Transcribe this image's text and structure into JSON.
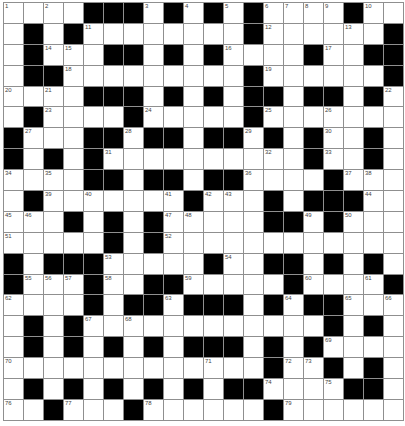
{
  "puzzle": {
    "rows": 20,
    "cols": 20,
    "colors": {
      "block": "#000000",
      "cell": "#ffffff",
      "gridline": "#8f8f8f",
      "number": "#444444"
    },
    "grid": [
      "....###.#.#.#....#..",
      ".#.#........#......#",
      ".#...##.#.#....#..##",
      ".##.........#......#",
      "....###.#.#.##.##.#.",
      ".#....#.....#.......",
      "#...##.##.##.#.#..#.",
      "#.#.#..........#..#.",
      "....##.##.##....#...",
      ".#.......#...#.###..",
      "...#.#.#.....##.#...",
      ".....#.#............",
      "#.###.....#..##.#.#.",
      "#...#..##.....#....#",
      "....#.##.###.#.##...",
      ".#.#............#.#.",
      ".#.#.#.#.###.#.#....",
      ".............#..#.#.",
      ".#.#.#.#.#.##....##.",
      "..#...#......#......"
    ],
    "numbers": [
      {
        "r": 0,
        "c": 0,
        "n": "1"
      },
      {
        "r": 0,
        "c": 2,
        "n": "2"
      },
      {
        "r": 0,
        "c": 7,
        "n": "3"
      },
      {
        "r": 0,
        "c": 9,
        "n": "4"
      },
      {
        "r": 0,
        "c": 11,
        "n": "5"
      },
      {
        "r": 0,
        "c": 13,
        "n": "6"
      },
      {
        "r": 0,
        "c": 14,
        "n": "7"
      },
      {
        "r": 0,
        "c": 15,
        "n": "8"
      },
      {
        "r": 0,
        "c": 16,
        "n": "9"
      },
      {
        "r": 0,
        "c": 18,
        "n": "10"
      },
      {
        "r": 1,
        "c": 4,
        "n": "11"
      },
      {
        "r": 1,
        "c": 13,
        "n": "12"
      },
      {
        "r": 1,
        "c": 17,
        "n": "13"
      },
      {
        "r": 2,
        "c": 2,
        "n": "14"
      },
      {
        "r": 2,
        "c": 3,
        "n": "15"
      },
      {
        "r": 2,
        "c": 11,
        "n": "16"
      },
      {
        "r": 2,
        "c": 16,
        "n": "17"
      },
      {
        "r": 3,
        "c": 3,
        "n": "18"
      },
      {
        "r": 3,
        "c": 13,
        "n": "19"
      },
      {
        "r": 4,
        "c": 0,
        "n": "20"
      },
      {
        "r": 4,
        "c": 2,
        "n": "21"
      },
      {
        "r": 4,
        "c": 19,
        "n": "22"
      },
      {
        "r": 5,
        "c": 2,
        "n": "23"
      },
      {
        "r": 5,
        "c": 7,
        "n": "24"
      },
      {
        "r": 5,
        "c": 13,
        "n": "25"
      },
      {
        "r": 5,
        "c": 16,
        "n": "26"
      },
      {
        "r": 6,
        "c": 1,
        "n": "27"
      },
      {
        "r": 6,
        "c": 6,
        "n": "28"
      },
      {
        "r": 6,
        "c": 12,
        "n": "29"
      },
      {
        "r": 6,
        "c": 16,
        "n": "30"
      },
      {
        "r": 7,
        "c": 5,
        "n": "31"
      },
      {
        "r": 7,
        "c": 13,
        "n": "32"
      },
      {
        "r": 7,
        "c": 16,
        "n": "33"
      },
      {
        "r": 8,
        "c": 0,
        "n": "34"
      },
      {
        "r": 8,
        "c": 2,
        "n": "35"
      },
      {
        "r": 8,
        "c": 12,
        "n": "36"
      },
      {
        "r": 8,
        "c": 17,
        "n": "37"
      },
      {
        "r": 8,
        "c": 18,
        "n": "38"
      },
      {
        "r": 9,
        "c": 2,
        "n": "39"
      },
      {
        "r": 9,
        "c": 4,
        "n": "40"
      },
      {
        "r": 9,
        "c": 8,
        "n": "41"
      },
      {
        "r": 9,
        "c": 10,
        "n": "42"
      },
      {
        "r": 9,
        "c": 11,
        "n": "43"
      },
      {
        "r": 9,
        "c": 18,
        "n": "44"
      },
      {
        "r": 10,
        "c": 0,
        "n": "45"
      },
      {
        "r": 10,
        "c": 1,
        "n": "46"
      },
      {
        "r": 10,
        "c": 8,
        "n": "47"
      },
      {
        "r": 10,
        "c": 9,
        "n": "48"
      },
      {
        "r": 10,
        "c": 15,
        "n": "49"
      },
      {
        "r": 10,
        "c": 17,
        "n": "50"
      },
      {
        "r": 11,
        "c": 0,
        "n": "51"
      },
      {
        "r": 11,
        "c": 8,
        "n": "52"
      },
      {
        "r": 12,
        "c": 5,
        "n": "53"
      },
      {
        "r": 12,
        "c": 11,
        "n": "54"
      },
      {
        "r": 13,
        "c": 1,
        "n": "55"
      },
      {
        "r": 13,
        "c": 2,
        "n": "56"
      },
      {
        "r": 13,
        "c": 3,
        "n": "57"
      },
      {
        "r": 13,
        "c": 5,
        "n": "58"
      },
      {
        "r": 13,
        "c": 9,
        "n": "59"
      },
      {
        "r": 13,
        "c": 15,
        "n": "60"
      },
      {
        "r": 13,
        "c": 18,
        "n": "61"
      },
      {
        "r": 14,
        "c": 0,
        "n": "62"
      },
      {
        "r": 14,
        "c": 8,
        "n": "63"
      },
      {
        "r": 14,
        "c": 14,
        "n": "64"
      },
      {
        "r": 14,
        "c": 17,
        "n": "65"
      },
      {
        "r": 14,
        "c": 19,
        "n": "66"
      },
      {
        "r": 15,
        "c": 4,
        "n": "67"
      },
      {
        "r": 15,
        "c": 6,
        "n": "68"
      },
      {
        "r": 16,
        "c": 16,
        "n": "69"
      },
      {
        "r": 17,
        "c": 0,
        "n": "70"
      },
      {
        "r": 17,
        "c": 10,
        "n": "71"
      },
      {
        "r": 17,
        "c": 14,
        "n": "72"
      },
      {
        "r": 17,
        "c": 15,
        "n": "73"
      },
      {
        "r": 18,
        "c": 13,
        "n": "74"
      },
      {
        "r": 18,
        "c": 16,
        "n": "75"
      },
      {
        "r": 19,
        "c": 0,
        "n": "76"
      },
      {
        "r": 19,
        "c": 3,
        "n": "77"
      },
      {
        "r": 19,
        "c": 7,
        "n": "78"
      },
      {
        "r": 19,
        "c": 14,
        "n": "79"
      }
    ]
  }
}
